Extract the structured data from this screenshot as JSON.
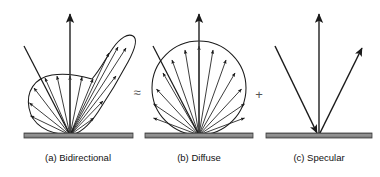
{
  "figure": {
    "equation_reading": "Bidirectional = Diffuse + Specular",
    "background_color": "#ffffff",
    "line_color": "#1a1a1a",
    "surface_color": "#8c8c8c",
    "surface_edge_color": "#3d3d3d",
    "operator_color": "#555555"
  },
  "operators": {
    "approx_equal": "≈",
    "plus": "+"
  },
  "panels": [
    {
      "id": "bidirectional",
      "caption": "(a) Bidirectional",
      "lobe_type": "bidirectional",
      "origin": {
        "x": 70,
        "y": 135
      },
      "surface": {
        "x": 24,
        "y": 133,
        "width": 109,
        "height": 5
      },
      "normal_arrow": {
        "x1": 70,
        "y1": 135,
        "x2": 70,
        "y2": 12
      },
      "incoming_ray": {
        "x1": 24,
        "y1": 46,
        "x2": 70,
        "y2": 135
      },
      "ray_count": 13,
      "lobe_description": "broad diffuse base with elongated specular lobe toward upper right"
    },
    {
      "id": "diffuse",
      "caption": "(b) Diffuse",
      "lobe_type": "circular",
      "origin": {
        "x": 199,
        "y": 135
      },
      "surface": {
        "x": 145,
        "y": 133,
        "width": 108,
        "height": 5
      },
      "normal_arrow": {
        "x1": 199,
        "y1": 135,
        "x2": 199,
        "y2": 12
      },
      "incoming_ray": {
        "x1": 153,
        "y1": 46,
        "x2": 199,
        "y2": 135
      },
      "ray_count": 13,
      "lobe_radius": 47,
      "lobe_description": "full circle Lambertian lobe with evenly spaced radiating arrows"
    },
    {
      "id": "specular",
      "caption": "(c) Specular",
      "lobe_type": "mirror",
      "origin": {
        "x": 319,
        "y": 135
      },
      "surface": {
        "x": 266,
        "y": 133,
        "width": 106,
        "height": 5
      },
      "normal_arrow": {
        "x1": 319,
        "y1": 135,
        "x2": 319,
        "y2": 12
      },
      "incoming_ray": {
        "x1": 275,
        "y1": 46,
        "x2": 319,
        "y2": 135
      },
      "reflected_ray": {
        "x1": 319,
        "y1": 135,
        "x2": 363,
        "y2": 46
      },
      "lobe_description": "single mirror-direction reflected ray"
    }
  ],
  "captions": {
    "a": "(a) Bidirectional",
    "b": "(b) Diffuse",
    "c": "(c) Specular"
  }
}
